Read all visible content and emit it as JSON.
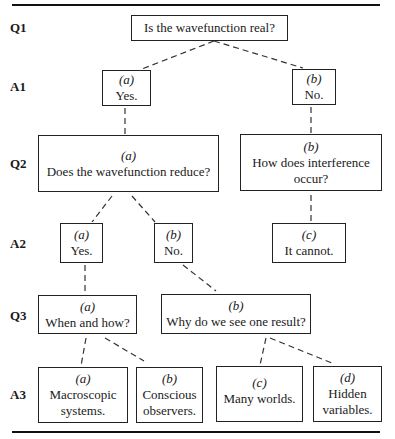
{
  "levels": [
    "Q1",
    "A1",
    "Q2",
    "A2",
    "Q3",
    "A3"
  ],
  "nodes": {
    "q1": {
      "tag": "",
      "text": "Is the wavefunction real?"
    },
    "a1a": {
      "tag": "(a)",
      "text": "Yes."
    },
    "a1b": {
      "tag": "(b)",
      "text": "No."
    },
    "q2a": {
      "tag": "(a)",
      "text": "Does the wavefunction reduce?"
    },
    "q2b": {
      "tag": "(b)",
      "line1": "How does interference",
      "line2": "occur?"
    },
    "a2a": {
      "tag": "(a)",
      "text": "Yes."
    },
    "a2b": {
      "tag": "(b)",
      "text": "No."
    },
    "a2c": {
      "tag": "(c)",
      "text": "It cannot."
    },
    "q3a": {
      "tag": "(a)",
      "text": "When and how?"
    },
    "q3b": {
      "tag": "(b)",
      "text": "Why do we see one result?"
    },
    "a3a": {
      "tag": "(a)",
      "line1": "Macroscopic",
      "line2": "systems."
    },
    "a3b": {
      "tag": "(b)",
      "line1": "Conscious",
      "line2": "observers."
    },
    "a3c": {
      "tag": "(c)",
      "text": "Many worlds."
    },
    "a3d": {
      "tag": "(d)",
      "line1": "Hidden",
      "line2": "variables."
    }
  },
  "edges": [
    [
      "q1",
      "a1a"
    ],
    [
      "q1",
      "a1b"
    ],
    [
      "a1a",
      "q2a"
    ],
    [
      "a1b",
      "q2b"
    ],
    [
      "q2a",
      "a2a"
    ],
    [
      "q2a",
      "a2b"
    ],
    [
      "q2b",
      "a2c"
    ],
    [
      "a2a",
      "q3a"
    ],
    [
      "a2b",
      "q3b"
    ],
    [
      "q3a",
      "a3a"
    ],
    [
      "q3a",
      "a3b"
    ],
    [
      "q3b",
      "a3c"
    ],
    [
      "q3b",
      "a3d"
    ]
  ],
  "colors": {
    "ink": "#222222",
    "background": "#ffffff"
  }
}
